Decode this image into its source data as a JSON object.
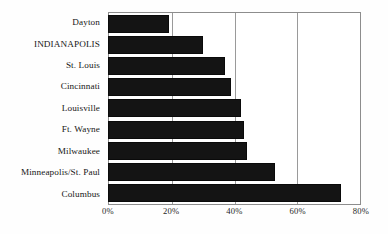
{
  "chart_data": {
    "type": "bar",
    "orientation": "horizontal",
    "title": "",
    "subtitle": "",
    "xlabel": "",
    "ylabel": "",
    "categories": [
      "Dayton",
      "INDIANAPOLIS",
      "St. Louis",
      "Cincinnati",
      "Louisville",
      "Ft. Wayne",
      "Milwaukee",
      "Minneapolis/St. Paul",
      "Columbus"
    ],
    "values": [
      19,
      30,
      37,
      39,
      42,
      43,
      44,
      53,
      74
    ],
    "value_unit": "%",
    "xlim": [
      0,
      80
    ],
    "tick_values": [
      0,
      20,
      40,
      60,
      80
    ],
    "tick_labels": [
      "0%",
      "20%",
      "40%",
      "60%",
      "80%"
    ],
    "grid": true,
    "grid_axis": "x",
    "legend": false,
    "legend_position": "none",
    "bar_color": "#141414",
    "gridline_color": "#9a9a9a",
    "plot_border_color": "#8d8d8d",
    "background_color": "#ffffff"
  }
}
